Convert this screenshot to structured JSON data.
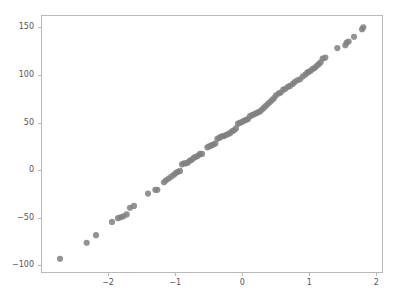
{
  "chart_data": {
    "type": "scatter",
    "title": "",
    "xlabel": "",
    "ylabel": "",
    "xlim": [
      -3.0,
      2.1
    ],
    "ylim": [
      -108,
      163
    ],
    "xticks": [
      -2,
      -1,
      0,
      1,
      2
    ],
    "xticklabels": [
      "−2",
      "−1",
      "0",
      "1",
      "2"
    ],
    "yticks": [
      -100,
      -50,
      0,
      50,
      100,
      150
    ],
    "yticklabels": [
      "−100",
      "−50",
      "0",
      "50",
      "100",
      "150"
    ],
    "grid": false,
    "legend": null,
    "marker": {
      "shape": "circle",
      "color": "#808080",
      "size": 3.1,
      "opacity": 0.85
    },
    "series": [
      {
        "name": "quantiles",
        "points": [
          [
            -2.73,
            -94
          ],
          [
            -2.33,
            -77
          ],
          [
            -2.19,
            -69
          ],
          [
            -1.95,
            -55
          ],
          [
            -1.86,
            -51
          ],
          [
            -1.82,
            -50
          ],
          [
            -1.78,
            -49
          ],
          [
            -1.73,
            -47
          ],
          [
            -1.68,
            -40
          ],
          [
            -1.62,
            -38
          ],
          [
            -1.41,
            -25
          ],
          [
            -1.3,
            -21
          ],
          [
            -1.27,
            -21
          ],
          [
            -1.17,
            -13
          ],
          [
            -1.14,
            -11
          ],
          [
            -1.1,
            -9
          ],
          [
            -1.06,
            -7
          ],
          [
            -1.02,
            -5
          ],
          [
            -0.99,
            -3
          ],
          [
            -0.96,
            -2
          ],
          [
            -0.93,
            -1
          ],
          [
            -0.9,
            6
          ],
          [
            -0.87,
            7
          ],
          [
            -0.84,
            7
          ],
          [
            -0.81,
            8
          ],
          [
            -0.78,
            10
          ],
          [
            -0.75,
            11
          ],
          [
            -0.72,
            13
          ],
          [
            -0.69,
            14
          ],
          [
            -0.66,
            15
          ],
          [
            -0.63,
            17
          ],
          [
            -0.6,
            17
          ],
          [
            -0.52,
            24
          ],
          [
            -0.49,
            25
          ],
          [
            -0.46,
            26
          ],
          [
            -0.43,
            27
          ],
          [
            -0.4,
            28
          ],
          [
            -0.37,
            33
          ],
          [
            -0.34,
            34
          ],
          [
            -0.32,
            35
          ],
          [
            -0.29,
            36
          ],
          [
            -0.27,
            36
          ],
          [
            -0.24,
            37
          ],
          [
            -0.21,
            38
          ],
          [
            -0.18,
            39
          ],
          [
            -0.15,
            41
          ],
          [
            -0.12,
            42
          ],
          [
            -0.09,
            44
          ],
          [
            -0.06,
            49
          ],
          [
            -0.03,
            50
          ],
          [
            0.0,
            51
          ],
          [
            0.03,
            52
          ],
          [
            0.06,
            53
          ],
          [
            0.09,
            54
          ],
          [
            0.12,
            57
          ],
          [
            0.15,
            58
          ],
          [
            0.18,
            59
          ],
          [
            0.21,
            60
          ],
          [
            0.24,
            61
          ],
          [
            0.27,
            62
          ],
          [
            0.3,
            64
          ],
          [
            0.33,
            66
          ],
          [
            0.36,
            68
          ],
          [
            0.39,
            70
          ],
          [
            0.42,
            72
          ],
          [
            0.45,
            74
          ],
          [
            0.48,
            76
          ],
          [
            0.51,
            79
          ],
          [
            0.55,
            81
          ],
          [
            0.58,
            82
          ],
          [
            0.62,
            85
          ],
          [
            0.65,
            86
          ],
          [
            0.69,
            88
          ],
          [
            0.72,
            89
          ],
          [
            0.76,
            91
          ],
          [
            0.79,
            93
          ],
          [
            0.83,
            95
          ],
          [
            0.87,
            96
          ],
          [
            0.91,
            99
          ],
          [
            0.95,
            101
          ],
          [
            0.98,
            103
          ],
          [
            1.0,
            104
          ],
          [
            1.03,
            105
          ],
          [
            1.06,
            107
          ],
          [
            1.09,
            108
          ],
          [
            1.12,
            110
          ],
          [
            1.15,
            112
          ],
          [
            1.18,
            114
          ],
          [
            1.21,
            118
          ],
          [
            1.25,
            119
          ],
          [
            1.43,
            129
          ],
          [
            1.55,
            132
          ],
          [
            1.57,
            135
          ],
          [
            1.6,
            136
          ],
          [
            1.68,
            141
          ],
          [
            1.8,
            149
          ],
          [
            1.82,
            151
          ]
        ]
      }
    ]
  },
  "axes": {
    "frame_color": "#b8b8b8",
    "background_color": "#ffffff",
    "tick_label_color": "#555555"
  }
}
